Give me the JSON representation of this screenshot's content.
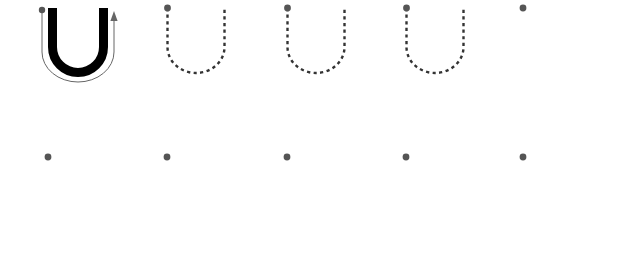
{
  "worksheet": {
    "title": "Letter U Tracing Practice Worksheet",
    "letter": "U",
    "page_width": 631,
    "page_height": 261,
    "background_color": "#ffffff"
  },
  "colors": {
    "solid_letter": "#000000",
    "dashed_letter": "#333333",
    "start_dot": "#555555",
    "guide_arrow": "#666666",
    "rule_line_light": "#d8d8d8",
    "rule_line_mid": "#b4b4b4",
    "rule_line_baseline": "#8c8c8c"
  },
  "rule_rows": [
    {
      "name": "practice-row-1",
      "lines": [
        {
          "name": "cap-line",
          "y": 8,
          "weight": 1.6,
          "color": "#d0d0d0"
        },
        {
          "name": "midline",
          "y": 38,
          "weight": 1.8,
          "color": "#b4b4b4"
        },
        {
          "name": "baseline",
          "y": 72,
          "weight": 2.4,
          "color": "#8c8c8c"
        },
        {
          "name": "descender-line",
          "y": 103,
          "weight": 1.6,
          "color": "#d8d8d8"
        }
      ]
    },
    {
      "name": "practice-row-2",
      "lines": [
        {
          "name": "cap-line",
          "y": 157,
          "weight": 1.6,
          "color": "#c9c9c9"
        },
        {
          "name": "midline",
          "y": 187,
          "weight": 1.8,
          "color": "#b4b4b4"
        },
        {
          "name": "baseline",
          "y": 221,
          "weight": 2.4,
          "color": "#8c8c8c"
        },
        {
          "name": "descender-line",
          "y": 252,
          "weight": 1.6,
          "color": "#d8d8d8"
        }
      ]
    }
  ],
  "line_extent": {
    "x_start": 30,
    "x_end": 608
  },
  "row1_glyphs": [
    {
      "name": "solid-letter-u",
      "style": "solid",
      "x_left": 48,
      "x_right": 108,
      "has_start_dot": true,
      "dot_x": 42,
      "has_guide_arrow": true
    },
    {
      "name": "dashed-letter-u-1",
      "style": "dashed",
      "x_left": 167,
      "x_right": 224,
      "has_start_dot": true,
      "dot_x": 167,
      "has_guide_arrow": false
    },
    {
      "name": "dashed-letter-u-2",
      "style": "dashed",
      "x_left": 287,
      "x_right": 344,
      "has_start_dot": true,
      "dot_x": 287,
      "has_guide_arrow": false
    },
    {
      "name": "dashed-letter-u-3",
      "style": "dashed",
      "x_left": 406,
      "x_right": 463,
      "has_start_dot": true,
      "dot_x": 406,
      "has_guide_arrow": false
    },
    {
      "name": "start-dot-only",
      "style": "dot-only",
      "x_left": 523,
      "x_right": 523,
      "has_start_dot": true,
      "dot_x": 523,
      "has_guide_arrow": false
    }
  ],
  "row2_glyphs": [
    {
      "name": "start-dot-1",
      "style": "dot-only",
      "dot_x": 48
    },
    {
      "name": "start-dot-2",
      "style": "dot-only",
      "dot_x": 167
    },
    {
      "name": "start-dot-3",
      "style": "dot-only",
      "dot_x": 287
    },
    {
      "name": "start-dot-4",
      "style": "dot-only",
      "dot_x": 406
    },
    {
      "name": "start-dot-5",
      "style": "dot-only",
      "dot_x": 523
    }
  ],
  "glyph_geometry": {
    "top_y": 8,
    "baseline_y": 72,
    "stroke_width_solid": 9,
    "stroke_width_dashed": 2.4,
    "dash_pattern": "3.2 3.4",
    "dot_radius": 3.4,
    "row2_dot_y": 157,
    "row1_dot_y": 8
  },
  "guide_arrow": {
    "name": "stroke-direction-arrow",
    "stroke_width": 1,
    "color": "#666666",
    "arrowhead_y": 14,
    "arrow_x": 108,
    "description": "thin outline path showing pen direction: down, around the bowl, and up with an arrowhead"
  }
}
